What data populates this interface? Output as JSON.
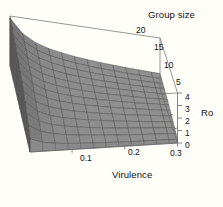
{
  "chart_data": {
    "type": "line",
    "plot_kind": "3d-surface",
    "title": "",
    "xlabel": "Virulence",
    "ylabel": "Group size",
    "zlabel": "Ro",
    "xticks": [
      "0.1",
      "0.2",
      "0.3"
    ],
    "xtick_values": [
      0.1,
      0.2,
      0.3
    ],
    "yticks": [
      "5",
      "10",
      "15",
      "20"
    ],
    "ytick_values": [
      5,
      10,
      15,
      20
    ],
    "zticks": [
      "0",
      "1",
      "2",
      "3",
      "4"
    ],
    "ztick_values": [
      0,
      1,
      2,
      3,
      4
    ],
    "xlim": [
      0.02,
      0.3
    ],
    "ylim": [
      0,
      20
    ],
    "zlim": [
      0,
      4
    ],
    "grid": true,
    "legend": false,
    "surface_color": "#8d8d8d",
    "mesh_line_color": "#4a4a4a",
    "side_face_color": "#5e5e5e",
    "box_line_color": "#6b6b6b",
    "background_color": "#fffef9",
    "text_color": "#121212",
    "x": [
      0.02,
      0.044,
      0.068,
      0.092,
      0.116,
      0.14,
      0.164,
      0.188,
      0.212,
      0.236,
      0.26,
      0.284,
      0.3
    ],
    "y": [
      0,
      1.67,
      3.33,
      5.0,
      6.67,
      8.33,
      10.0,
      11.67,
      13.33,
      15.0,
      16.67,
      18.33,
      20
    ],
    "series": [
      {
        "name": "Group size 0",
        "values": [
          1.05,
          0.72,
          0.58,
          0.5,
          0.45,
          0.41,
          0.38,
          0.36,
          0.34,
          0.33,
          0.32,
          0.31,
          0.3
        ]
      },
      {
        "name": "Group size 1.67",
        "values": [
          1.55,
          1.02,
          0.8,
          0.68,
          0.6,
          0.55,
          0.51,
          0.48,
          0.45,
          0.43,
          0.42,
          0.41,
          0.4
        ]
      },
      {
        "name": "Group size 3.33",
        "values": [
          1.95,
          1.28,
          1.0,
          0.85,
          0.75,
          0.68,
          0.63,
          0.59,
          0.56,
          0.54,
          0.52,
          0.51,
          0.5
        ]
      },
      {
        "name": "Group size 5",
        "values": [
          2.3,
          1.52,
          1.18,
          1.0,
          0.89,
          0.81,
          0.75,
          0.7,
          0.67,
          0.64,
          0.62,
          0.61,
          0.6
        ]
      },
      {
        "name": "Group size 6.67",
        "values": [
          2.6,
          1.73,
          1.35,
          1.15,
          1.02,
          0.93,
          0.86,
          0.81,
          0.77,
          0.74,
          0.72,
          0.7,
          0.69
        ]
      },
      {
        "name": "Group size 8.33",
        "values": [
          2.85,
          1.92,
          1.5,
          1.28,
          1.13,
          1.03,
          0.96,
          0.9,
          0.86,
          0.83,
          0.8,
          0.78,
          0.77
        ]
      },
      {
        "name": "Group size 10",
        "values": [
          3.06,
          2.08,
          1.63,
          1.39,
          1.24,
          1.13,
          1.05,
          0.99,
          0.94,
          0.9,
          0.88,
          0.86,
          0.85
        ]
      },
      {
        "name": "Group size 11.67",
        "values": [
          3.24,
          2.22,
          1.75,
          1.49,
          1.33,
          1.21,
          1.13,
          1.06,
          1.01,
          0.97,
          0.94,
          0.92,
          0.91
        ]
      },
      {
        "name": "Group size 13.33",
        "values": [
          3.4,
          2.35,
          1.85,
          1.58,
          1.41,
          1.29,
          1.2,
          1.13,
          1.08,
          1.04,
          1.01,
          0.99,
          0.97
        ]
      },
      {
        "name": "Group size 15",
        "values": [
          3.53,
          2.46,
          1.94,
          1.66,
          1.48,
          1.36,
          1.26,
          1.19,
          1.14,
          1.09,
          1.06,
          1.04,
          1.02
        ]
      },
      {
        "name": "Group size 16.67",
        "values": [
          3.65,
          2.56,
          2.02,
          1.74,
          1.55,
          1.42,
          1.32,
          1.25,
          1.19,
          1.15,
          1.11,
          1.09,
          1.07
        ]
      },
      {
        "name": "Group size 18.33",
        "values": [
          3.75,
          2.65,
          2.1,
          1.8,
          1.61,
          1.47,
          1.37,
          1.3,
          1.24,
          1.19,
          1.16,
          1.13,
          1.12
        ]
      },
      {
        "name": "Group size 20",
        "values": [
          3.84,
          2.73,
          2.17,
          1.86,
          1.67,
          1.52,
          1.42,
          1.34,
          1.28,
          1.23,
          1.2,
          1.17,
          1.16
        ]
      }
    ],
    "annotations": []
  },
  "labels": {
    "group_size_title": "Group size",
    "virulence_title": "Virulence",
    "ro_title": "Ro",
    "gs_20": "20",
    "gs_15": "15",
    "gs_10": "10",
    "gs_5": "5",
    "ro_4": "4",
    "ro_3": "3",
    "ro_2": "2",
    "ro_1": "1",
    "ro_0": "0",
    "v_01": "0.1",
    "v_02": "0.2",
    "v_03": "0.3"
  }
}
